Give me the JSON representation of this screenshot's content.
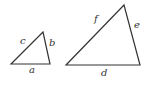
{
  "triangles": [
    {
      "name": "small",
      "vertices": [
        [
          11,
          64
        ],
        [
          43,
          32
        ],
        [
          50,
          64
        ]
      ],
      "labels": {
        "hyp": {
          "text": "c",
          "x": 20,
          "y": 44
        },
        "right": {
          "text": "b",
          "x": 49,
          "y": 46
        },
        "base": {
          "text": "a",
          "x": 29,
          "y": 73
        }
      }
    },
    {
      "name": "large",
      "vertices": [
        [
          66,
          65
        ],
        [
          124,
          5
        ],
        [
          140,
          65
        ]
      ],
      "labels": {
        "hyp": {
          "text": "f",
          "x": 94,
          "y": 22
        },
        "right": {
          "text": "e",
          "x": 134,
          "y": 28
        },
        "base": {
          "text": "d",
          "x": 101,
          "y": 76
        }
      }
    }
  ],
  "colors": {
    "stroke": "#333333"
  }
}
